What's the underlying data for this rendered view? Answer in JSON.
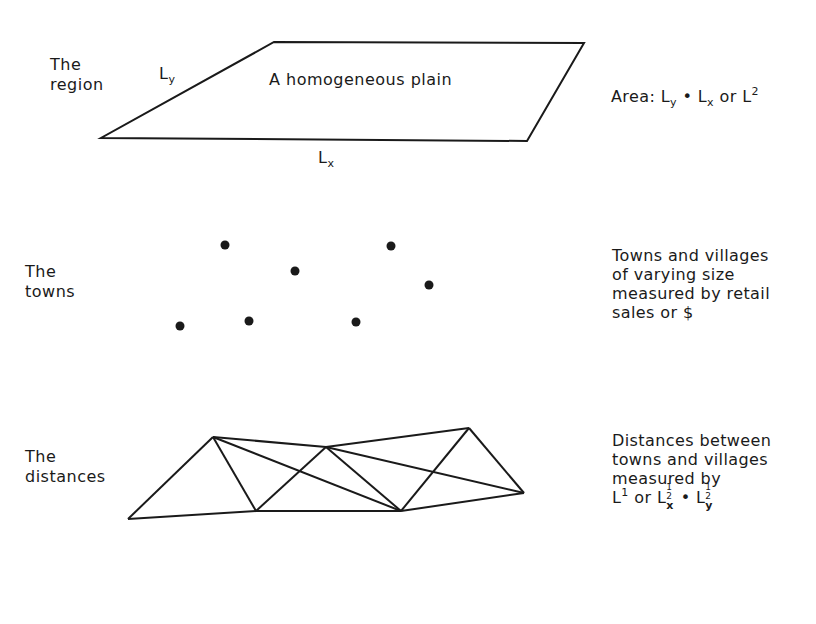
{
  "rows": [
    {
      "id": "region",
      "label_lines": [
        "The",
        "region"
      ],
      "shape_label": "A homogeneous plain",
      "side_labels": {
        "ly": "L",
        "ly_sub": "y",
        "lx": "L",
        "lx_sub": "x"
      },
      "description": {
        "prefix": "Area: ",
        "ly": "L",
        "ly_sub": "y",
        "dot": " • ",
        "lx": "L",
        "lx_sub": "x",
        "or": " or ",
        "l": "L",
        "l_sup": "2"
      }
    },
    {
      "id": "towns",
      "label_lines": [
        "The",
        "towns"
      ],
      "points": [
        [
          225,
          245
        ],
        [
          391,
          246
        ],
        [
          295,
          271
        ],
        [
          429,
          285
        ],
        [
          180,
          326
        ],
        [
          249,
          321
        ],
        [
          356,
          322
        ]
      ],
      "description_lines": [
        "Towns and villages",
        "of varying size",
        "measured by retail",
        "sales or $"
      ]
    },
    {
      "id": "distances",
      "label_lines": [
        "The",
        "distances"
      ],
      "nodes": {
        "A": [
          128,
          519
        ],
        "B": [
          213,
          437
        ],
        "C": [
          256,
          511
        ],
        "D": [
          326,
          447
        ],
        "E": [
          401,
          511
        ],
        "F": [
          469,
          428
        ],
        "G": [
          524,
          493
        ]
      },
      "edges": [
        [
          "A",
          "B"
        ],
        [
          "A",
          "C"
        ],
        [
          "B",
          "C"
        ],
        [
          "B",
          "D"
        ],
        [
          "B",
          "E"
        ],
        [
          "C",
          "D"
        ],
        [
          "C",
          "E"
        ],
        [
          "D",
          "E"
        ],
        [
          "D",
          "F"
        ],
        [
          "D",
          "G"
        ],
        [
          "E",
          "F"
        ],
        [
          "E",
          "G"
        ],
        [
          "F",
          "G"
        ]
      ],
      "description_lines": [
        "Distances between",
        "towns and villages",
        "measured by"
      ],
      "formula": {
        "l1": "L",
        "l1_sup": "1",
        "or": " or ",
        "lx": "L",
        "frac_n": "1",
        "frac_d": "2",
        "x": "x",
        "dot": " • ",
        "ly": "L",
        "y": "y"
      }
    }
  ]
}
